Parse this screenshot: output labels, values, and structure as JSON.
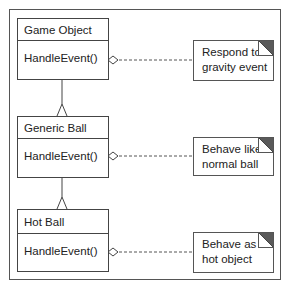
{
  "diagram": {
    "type": "uml-class",
    "classes": [
      {
        "name": "Game Object",
        "operation": "HandleEvent()"
      },
      {
        "name": "Generic Ball",
        "operation": "HandleEvent()"
      },
      {
        "name": "Hot Ball",
        "operation": "HandleEvent()"
      }
    ],
    "notes": [
      {
        "text": "Respond to\ngravity event"
      },
      {
        "text": "Behave like\nnormal ball"
      },
      {
        "text": "Behave as\nhot object"
      }
    ],
    "colors": {
      "line": "#444444",
      "frame": "#555555",
      "corner_dark": "#5a5a5a",
      "background": "#ffffff"
    }
  }
}
